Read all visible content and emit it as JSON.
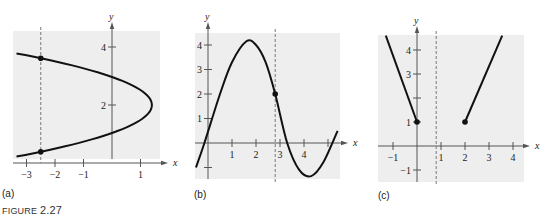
{
  "figure": {
    "caption_prefix": "FIGURE ",
    "caption_number": "2.27"
  },
  "colors": {
    "panel_bg": "#eeeeee",
    "curve": "#111111",
    "axis": "#555555",
    "dashed": "#777777"
  },
  "chart_data": [
    {
      "panel": "(a)",
      "type": "line",
      "description": "Sideways parabola opening left (not a function); vertical dashed line intersects graph at two points",
      "xlabel": "x",
      "ylabel": "y",
      "xlim": [
        -3.4,
        1.7
      ],
      "ylim": [
        -0.3,
        4.5
      ],
      "x_ticks": [
        -3,
        -2,
        -1,
        1
      ],
      "x_tick_labels": [
        "−3",
        "−2",
        "−1",
        "1"
      ],
      "y_ticks": [
        2,
        4
      ],
      "y_tick_labels": [
        "2",
        "4"
      ],
      "series": [
        {
          "name": "x = 1.4 − 1.5(y − 2)²",
          "y_range": [
            0.22,
            3.78
          ],
          "vertex": [
            1.4,
            2
          ]
        }
      ],
      "vertical_line_x": -2.5,
      "points": [
        [
          -2.5,
          3.61
        ],
        [
          -2.5,
          0.39
        ]
      ],
      "grid": false
    },
    {
      "panel": "(b)",
      "type": "line",
      "description": "Cubic-like curve; vertical dashed line intersects graph once",
      "xlabel": "x",
      "ylabel": "y",
      "xlim": [
        -0.5,
        5.5
      ],
      "ylim": [
        -1.5,
        4.6
      ],
      "x_ticks": [
        1,
        2,
        3,
        4,
        5
      ],
      "x_tick_labels": [
        "1",
        "2",
        "3",
        "4",
        ""
      ],
      "y_ticks": [
        -1,
        1,
        2,
        3,
        4
      ],
      "y_tick_labels": [
        "",
        "1",
        "2",
        "3",
        "4"
      ],
      "series": [
        {
          "name": "f",
          "x": [
            -0.5,
            -0.15,
            0.5,
            1.0,
            1.6,
            2.0,
            2.4,
            2.8,
            3.3,
            3.8,
            4.3,
            4.8,
            5.4
          ],
          "y": [
            -1.0,
            0.0,
            2.0,
            3.3,
            4.15,
            4.0,
            3.3,
            2.0,
            0.0,
            -1.1,
            -1.35,
            -0.8,
            0.5
          ]
        }
      ],
      "vertical_line_x": 2.8,
      "points": [
        [
          2.8,
          2.0
        ]
      ],
      "grid": false
    },
    {
      "panel": "(c)",
      "type": "line",
      "description": "Two line segments (V-shaped with gap); vertical dashed line at x≈0.8 does not intersect",
      "xlabel": "x",
      "ylabel": "y",
      "xlim": [
        -1.6,
        4.5
      ],
      "ylim": [
        -1.5,
        4.6
      ],
      "x_ticks": [
        -1,
        1,
        2,
        3,
        4
      ],
      "x_tick_labels": [
        "−1",
        "1",
        "2",
        "3",
        "4"
      ],
      "y_ticks": [
        -1,
        1,
        2,
        3,
        4
      ],
      "y_tick_labels": [
        "−1",
        "1",
        "",
        "3",
        "4"
      ],
      "series": [
        {
          "name": "left segment",
          "x": [
            -1.3,
            0
          ],
          "y": [
            4.6,
            1
          ]
        },
        {
          "name": "right segment",
          "x": [
            2,
            3.55
          ],
          "y": [
            1,
            4.6
          ]
        }
      ],
      "vertical_line_x": 0.8,
      "points": [
        [
          0,
          1
        ],
        [
          2,
          1
        ]
      ],
      "grid": false
    }
  ],
  "panels": [
    {
      "label": "(a)",
      "bg": {
        "x": 13,
        "y": 31,
        "w": 147,
        "h": 128
      },
      "origin": [
        112,
        163
      ],
      "ux": 28.5,
      "uy": 29,
      "xaxis": [
        13,
        168
      ],
      "yaxis": [
        159,
        22
      ]
    },
    {
      "label": "(b)",
      "bg": {
        "x": 195,
        "y": 33,
        "w": 145,
        "h": 146
      },
      "origin": [
        208,
        143
      ],
      "ux": 24,
      "uy": 24.5,
      "xaxis": [
        195,
        348
      ],
      "yaxis": [
        179,
        22
      ]
    },
    {
      "label": "(c)",
      "bg": {
        "x": 378,
        "y": 35,
        "w": 146,
        "h": 147
      },
      "origin": [
        417,
        146
      ],
      "ux": 24,
      "uy": 24,
      "xaxis": [
        378,
        530
      ],
      "yaxis": [
        182,
        26
      ]
    }
  ]
}
